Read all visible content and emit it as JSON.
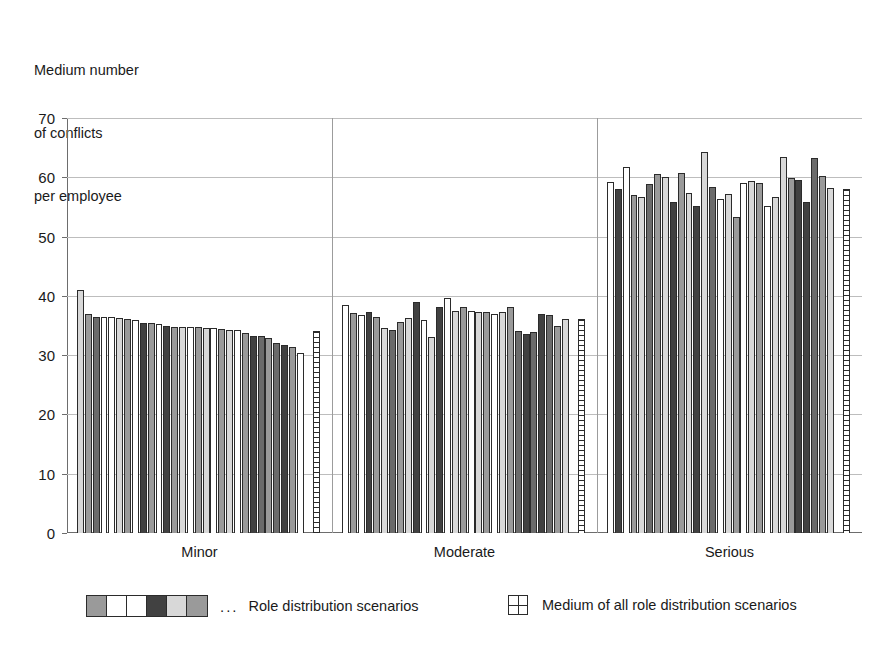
{
  "chart_data": {
    "type": "bar",
    "title": "",
    "subtitle": "",
    "ylabel_lines": [
      "Medium number",
      "of conflicts",
      "per employee"
    ],
    "xlabel": "",
    "ylim": [
      0,
      70
    ],
    "y_ticks": [
      0,
      10,
      20,
      30,
      40,
      50,
      60,
      70
    ],
    "grid": "horizontal",
    "legend_position": "bottom",
    "categories": [
      "Minor",
      "Moderate",
      "Serious"
    ],
    "series_note": "Each category shows 26 individual role-distribution-scenario bars followed by a separate cross-hatched bar giving the medium (average) of all scenarios.",
    "groups": [
      {
        "category": "Minor",
        "scenario_values": [
          41.0,
          36.9,
          36.5,
          36.4,
          36.4,
          36.2,
          36.1,
          35.9,
          35.5,
          35.4,
          35.2,
          34.9,
          34.8,
          34.8,
          34.8,
          34.7,
          34.6,
          34.5,
          34.4,
          34.3,
          34.2,
          33.8,
          33.3,
          33.2,
          32.9,
          32.0,
          31.7,
          31.4,
          30.4
        ],
        "scenario_fills": [
          "light",
          "mid",
          "dark",
          "white",
          "white",
          "light",
          "mid",
          "white",
          "vdark",
          "mid",
          "white",
          "vdark",
          "mid",
          "light",
          "white",
          "mid",
          "light",
          "white",
          "mid",
          "light",
          "white",
          "mid",
          "vdark",
          "dark",
          "mid",
          "dark",
          "vdark",
          "mid",
          "white"
        ],
        "medium_value": 34.1
      },
      {
        "category": "Moderate",
        "scenario_values": [
          38.5,
          37.1,
          36.7,
          37.3,
          36.5,
          34.6,
          34.3,
          35.6,
          36.3,
          39.0,
          36.0,
          33.1,
          38.1,
          39.6,
          37.5,
          38.1,
          37.5,
          37.2,
          37.2,
          36.9,
          37.3,
          38.2,
          34.0,
          33.5,
          33.9,
          36.9,
          36.7,
          35.0,
          36.1
        ],
        "scenario_fills": [
          "white",
          "mid",
          "white",
          "vdark",
          "mid",
          "light",
          "dark",
          "mid",
          "light",
          "vdark",
          "white",
          "light",
          "vdark",
          "white",
          "light",
          "mid",
          "white",
          "light",
          "mid",
          "white",
          "light",
          "mid",
          "dark",
          "vdark",
          "dark",
          "vdark",
          "dark",
          "mid",
          "light"
        ],
        "medium_value": 36.1
      },
      {
        "category": "Serious",
        "scenario_values": [
          59.2,
          58.1,
          61.8,
          57.0,
          56.7,
          58.8,
          60.5,
          60.1,
          55.9,
          60.7,
          57.4,
          55.2,
          64.2,
          58.4,
          56.3,
          57.1,
          53.3,
          59.0,
          59.4,
          59.1,
          55.2,
          56.6,
          63.4,
          59.8,
          59.5,
          55.8,
          63.3,
          60.2,
          58.2
        ],
        "scenario_fills": [
          "white",
          "vdark",
          "white",
          "mid",
          "light",
          "dark",
          "mid",
          "light",
          "vdark",
          "mid",
          "light",
          "vdark",
          "light",
          "dark",
          "white",
          "light",
          "mid",
          "white",
          "light",
          "mid",
          "white",
          "light",
          "light",
          "mid",
          "vdark",
          "vdark",
          "dark",
          "mid",
          "light"
        ],
        "medium_value": 58.1
      }
    ],
    "legend": [
      {
        "swatch_type": "strip",
        "swatch_fills": [
          "mid",
          "white",
          "white",
          "vdark",
          "light",
          "mid"
        ],
        "dots": "...",
        "label": "Role distribution scenarios"
      },
      {
        "swatch_type": "grid",
        "dots": "",
        "label": "Medium of all role distribution scenarios"
      }
    ],
    "colors": {
      "white": "#ffffff",
      "light": "#d8d8d8",
      "lightgray": "#c2c2c2",
      "mid": "#9a9a9a",
      "dark": "#6b6b6b",
      "vdark": "#414141",
      "outline": "#2b2b2b",
      "gridline": "#bdbdbd",
      "axis": "#6d6d6d",
      "text": "#1a1a1a"
    }
  }
}
